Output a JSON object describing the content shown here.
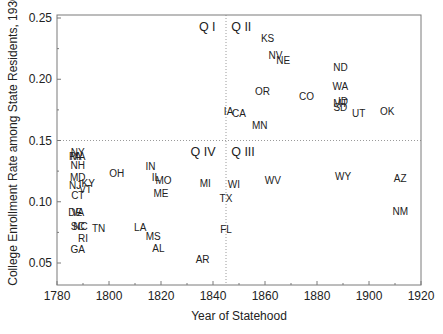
{
  "chart_data": {
    "type": "scatter",
    "title": "",
    "xlabel": "Year of Statehood",
    "ylabel": "College Enrollment Rate among State Residents, 1930",
    "xlim": [
      1780,
      1920
    ],
    "ylim": [
      0.033,
      0.255
    ],
    "x_ticks": [
      1780,
      1800,
      1820,
      1840,
      1860,
      1880,
      1900,
      1920
    ],
    "y_ticks": [
      0.05,
      0.1,
      0.15,
      0.2,
      0.25
    ],
    "y_tick_labels": [
      "0.05",
      "0.10",
      "0.15",
      "0.20",
      "0.25"
    ],
    "grid": false,
    "legend": null,
    "reference_lines": {
      "vertical_x": 1845,
      "horizontal_y": 0.15,
      "style": "dotted"
    },
    "quadrant_labels": [
      {
        "text": "Q I",
        "x": 1841,
        "y": 0.243,
        "anchor": "end"
      },
      {
        "text": "Q II",
        "x": 1847,
        "y": 0.243,
        "anchor": "start"
      },
      {
        "text": "Q IV",
        "x": 1841,
        "y": 0.141,
        "anchor": "end"
      },
      {
        "text": "Q III",
        "x": 1847,
        "y": 0.141,
        "anchor": "start"
      }
    ],
    "points": [
      {
        "label": "NY",
        "x": 1788,
        "y": 0.14
      },
      {
        "label": "MA",
        "x": 1788,
        "y": 0.137
      },
      {
        "label": "PA",
        "x": 1787,
        "y": 0.137
      },
      {
        "label": "NH",
        "x": 1788,
        "y": 0.13
      },
      {
        "label": "MD",
        "x": 1788,
        "y": 0.12
      },
      {
        "label": "NJ",
        "x": 1787,
        "y": 0.113
      },
      {
        "label": "KY",
        "x": 1792,
        "y": 0.115
      },
      {
        "label": "VT",
        "x": 1791,
        "y": 0.11
      },
      {
        "label": "CT",
        "x": 1788,
        "y": 0.105
      },
      {
        "label": "DE",
        "x": 1787,
        "y": 0.091
      },
      {
        "label": "VA",
        "x": 1788,
        "y": 0.091
      },
      {
        "label": "NC",
        "x": 1789,
        "y": 0.08
      },
      {
        "label": "SC",
        "x": 1788,
        "y": 0.08
      },
      {
        "label": "TN",
        "x": 1796,
        "y": 0.078
      },
      {
        "label": "RI",
        "x": 1790,
        "y": 0.07
      },
      {
        "label": "GA",
        "x": 1788,
        "y": 0.061
      },
      {
        "label": "OH",
        "x": 1803,
        "y": 0.123
      },
      {
        "label": "IN",
        "x": 1816,
        "y": 0.129
      },
      {
        "label": "IL",
        "x": 1818,
        "y": 0.12
      },
      {
        "label": "MO",
        "x": 1821,
        "y": 0.117
      },
      {
        "label": "ME",
        "x": 1820,
        "y": 0.107
      },
      {
        "label": "LA",
        "x": 1812,
        "y": 0.079
      },
      {
        "label": "MS",
        "x": 1817,
        "y": 0.072
      },
      {
        "label": "AL",
        "x": 1819,
        "y": 0.062
      },
      {
        "label": "AR",
        "x": 1836,
        "y": 0.053
      },
      {
        "label": "MI",
        "x": 1837,
        "y": 0.115
      },
      {
        "label": "TX",
        "x": 1845,
        "y": 0.103
      },
      {
        "label": "FL",
        "x": 1845,
        "y": 0.077
      },
      {
        "label": "WI",
        "x": 1848,
        "y": 0.114
      },
      {
        "label": "WV",
        "x": 1863,
        "y": 0.117
      },
      {
        "label": "WY",
        "x": 1890,
        "y": 0.121
      },
      {
        "label": "AZ",
        "x": 1912,
        "y": 0.119
      },
      {
        "label": "NM",
        "x": 1912,
        "y": 0.092
      },
      {
        "label": "KS",
        "x": 1861,
        "y": 0.233
      },
      {
        "label": "NV",
        "x": 1864,
        "y": 0.219
      },
      {
        "label": "NE",
        "x": 1867,
        "y": 0.215
      },
      {
        "label": "ND",
        "x": 1889,
        "y": 0.21
      },
      {
        "label": "WA",
        "x": 1889,
        "y": 0.194
      },
      {
        "label": "OR",
        "x": 1859,
        "y": 0.19
      },
      {
        "label": "CO",
        "x": 1876,
        "y": 0.186
      },
      {
        "label": "MT",
        "x": 1889,
        "y": 0.18
      },
      {
        "label": "ID",
        "x": 1890,
        "y": 0.182
      },
      {
        "label": "SD",
        "x": 1889,
        "y": 0.177
      },
      {
        "label": "UT",
        "x": 1896,
        "y": 0.172
      },
      {
        "label": "OK",
        "x": 1907,
        "y": 0.174
      },
      {
        "label": "IA",
        "x": 1846,
        "y": 0.174
      },
      {
        "label": "CA",
        "x": 1850,
        "y": 0.172
      },
      {
        "label": "MN",
        "x": 1858,
        "y": 0.162
      }
    ]
  },
  "colors": {
    "frame": "#7a7a7a",
    "reference_line": "#9a9a9a",
    "text": "#222222",
    "background": "#ffffff"
  }
}
